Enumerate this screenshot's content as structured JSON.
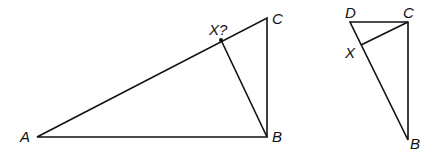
{
  "figure1": {
    "points": {
      "A": {
        "label": "A",
        "x": 37,
        "y": 137
      },
      "B": {
        "label": "B",
        "x": 267,
        "y": 137
      },
      "C": {
        "label": "C",
        "x": 267,
        "y": 18
      },
      "X": {
        "label": "X?",
        "x": 221,
        "y": 40
      }
    },
    "segments": [
      "AB",
      "BC",
      "CA",
      "XB"
    ]
  },
  "figure2": {
    "points": {
      "D": {
        "label": "D",
        "x": 350,
        "y": 22
      },
      "C": {
        "label": "C",
        "x": 408,
        "y": 22
      },
      "B": {
        "label": "B",
        "x": 408,
        "y": 140
      },
      "X": {
        "label": "X",
        "x": 361,
        "y": 45
      }
    },
    "segments": [
      "DC",
      "CB",
      "BD",
      "XC"
    ]
  },
  "colors": {
    "stroke": "#111111",
    "background": "#ffffff"
  }
}
